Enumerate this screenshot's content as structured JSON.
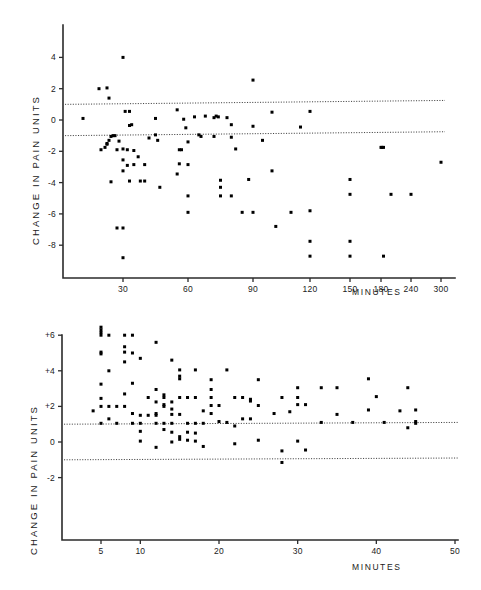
{
  "figure": {
    "y_axis_title": "CHANGE  IN  PAIN  UNITS",
    "x_axis_title": "MINUTES"
  },
  "chart_data": [
    {
      "id": "upper-panel",
      "type": "scatter",
      "title": "",
      "xlabel": "MINUTES",
      "ylabel": "CHANGE IN PAIN UNITS",
      "x_scale": "piecewise-compressed",
      "xlim": [
        0,
        310
      ],
      "ylim": [
        -9.4,
        5.2
      ],
      "grid": false,
      "legend": "none",
      "xtick_labels": [
        "30",
        "60",
        "90",
        "120",
        "150",
        "180",
        "240",
        "300"
      ],
      "xtick_values": [
        30,
        60,
        90,
        120,
        150,
        180,
        240,
        300
      ],
      "ytick_labels": [
        "4",
        "2",
        "0",
        "-2",
        "-4",
        "-6",
        "-8"
      ],
      "ytick_values": [
        4,
        2,
        0,
        -2,
        -4,
        -6,
        -8
      ],
      "reference_lines": [
        {
          "label": "upper-limit",
          "y_left": 1.0,
          "y_right": 1.25,
          "style": "dotted"
        },
        {
          "label": "lower-limit",
          "y_left": -1.0,
          "y_right": -0.75,
          "style": "dotted"
        }
      ],
      "points": [
        [
          10,
          0.1
        ],
        [
          18,
          2.0
        ],
        [
          22,
          2.05
        ],
        [
          23,
          1.4
        ],
        [
          30,
          4.0
        ],
        [
          90,
          2.55
        ],
        [
          19,
          -1.9
        ],
        [
          21,
          -1.75
        ],
        [
          22,
          -1.5
        ],
        [
          22,
          -1.55
        ],
        [
          23,
          -1.3
        ],
        [
          24,
          -1.05
        ],
        [
          25,
          -1.0
        ],
        [
          26,
          -1.0
        ],
        [
          27,
          -1.9
        ],
        [
          28,
          -1.35
        ],
        [
          24,
          -3.95
        ],
        [
          30,
          -3.25
        ],
        [
          30,
          -1.85
        ],
        [
          31,
          0.55
        ],
        [
          33,
          0.55
        ],
        [
          32,
          -1.9
        ],
        [
          33,
          -0.35
        ],
        [
          34,
          -0.3
        ],
        [
          35,
          -1.95
        ],
        [
          30,
          -2.55
        ],
        [
          32,
          -2.9
        ],
        [
          35,
          -2.85
        ],
        [
          33,
          -3.9
        ],
        [
          37,
          -2.35
        ],
        [
          38,
          -3.9
        ],
        [
          40,
          -2.85
        ],
        [
          40,
          -3.9
        ],
        [
          42,
          -1.15
        ],
        [
          45,
          0.1
        ],
        [
          45,
          -0.95
        ],
        [
          46,
          -1.3
        ],
        [
          47,
          -4.3
        ],
        [
          30,
          -6.9
        ],
        [
          27,
          -6.9
        ],
        [
          30,
          -8.8
        ],
        [
          55,
          0.65
        ],
        [
          56,
          -1.9
        ],
        [
          57,
          -1.9
        ],
        [
          56,
          -2.8
        ],
        [
          55,
          -3.45
        ],
        [
          58,
          0.05
        ],
        [
          59,
          -0.5
        ],
        [
          60,
          -1.4
        ],
        [
          60,
          -2.85
        ],
        [
          60,
          -4.85
        ],
        [
          60,
          -5.9
        ],
        [
          63,
          0.2
        ],
        [
          65,
          -0.95
        ],
        [
          66,
          -1.05
        ],
        [
          68,
          0.25
        ],
        [
          72,
          0.15
        ],
        [
          73,
          0.25
        ],
        [
          74,
          0.2
        ],
        [
          72,
          -1.05
        ],
        [
          75,
          -3.85
        ],
        [
          75,
          -4.3
        ],
        [
          75,
          -4.85
        ],
        [
          78,
          0.15
        ],
        [
          80,
          -0.3
        ],
        [
          80,
          -1.1
        ],
        [
          80,
          -4.85
        ],
        [
          82,
          -1.85
        ],
        [
          85,
          -5.9
        ],
        [
          88,
          -3.8
        ],
        [
          90,
          -0.4
        ],
        [
          90,
          -5.9
        ],
        [
          95,
          -1.3
        ],
        [
          100,
          0.5
        ],
        [
          100,
          -3.25
        ],
        [
          102,
          -6.8
        ],
        [
          110,
          -5.9
        ],
        [
          115,
          -0.45
        ],
        [
          120,
          0.55
        ],
        [
          120,
          -5.8
        ],
        [
          120,
          -7.75
        ],
        [
          120,
          -8.7
        ],
        [
          150,
          -3.8
        ],
        [
          150,
          -4.75
        ],
        [
          150,
          -7.75
        ],
        [
          150,
          -8.7
        ],
        [
          180,
          -1.75
        ],
        [
          182,
          -1.75
        ],
        [
          185,
          -1.75
        ],
        [
          185,
          -8.7
        ],
        [
          200,
          -4.75
        ],
        [
          240,
          -4.75
        ],
        [
          300,
          -2.7
        ]
      ]
    },
    {
      "id": "lower-panel",
      "type": "scatter",
      "title": "",
      "xlabel": "MINUTES",
      "ylabel": "CHANGE IN PAIN UNITS",
      "x_scale": "linear",
      "xlim": [
        0,
        50
      ],
      "ylim": [
        -3.2,
        6.7
      ],
      "grid": false,
      "legend": "none",
      "xtick_labels": [
        "5",
        "10",
        "20",
        "30",
        "40",
        "50"
      ],
      "xtick_values": [
        5,
        10,
        20,
        30,
        40,
        50
      ],
      "ytick_labels": [
        "+6",
        "+4",
        "+2",
        "0",
        "-2"
      ],
      "ytick_values": [
        6,
        4,
        2,
        0,
        -2
      ],
      "reference_lines": [
        {
          "label": "upper-limit",
          "y_left": 1.0,
          "y_right": 1.1,
          "style": "dotted"
        },
        {
          "label": "lower-limit",
          "y_left": -1.0,
          "y_right": -0.9,
          "style": "dotted"
        }
      ],
      "points": [
        [
          5,
          6.45
        ],
        [
          5,
          6.3
        ],
        [
          5,
          6.15
        ],
        [
          5,
          6.0
        ],
        [
          6,
          6.0
        ],
        [
          8,
          6.0
        ],
        [
          9,
          6.0
        ],
        [
          5,
          5.05
        ],
        [
          5,
          4.95
        ],
        [
          8,
          5.05
        ],
        [
          9,
          5.0
        ],
        [
          12,
          5.6
        ],
        [
          8,
          5.35
        ],
        [
          8,
          4.5
        ],
        [
          10,
          4.7
        ],
        [
          14,
          4.6
        ],
        [
          6,
          4.0
        ],
        [
          15,
          4.05
        ],
        [
          17,
          4.05
        ],
        [
          21,
          4.05
        ],
        [
          5,
          3.25
        ],
        [
          9,
          3.3
        ],
        [
          12,
          2.95
        ],
        [
          15,
          3.7
        ],
        [
          15,
          3.55
        ],
        [
          19,
          3.5
        ],
        [
          19,
          2.95
        ],
        [
          25,
          3.5
        ],
        [
          30,
          3.05
        ],
        [
          33,
          3.05
        ],
        [
          35,
          3.05
        ],
        [
          39,
          3.55
        ],
        [
          44,
          3.05
        ],
        [
          5,
          2.45
        ],
        [
          8,
          2.7
        ],
        [
          11,
          2.5
        ],
        [
          13,
          2.5
        ],
        [
          13,
          2.65
        ],
        [
          15,
          2.5
        ],
        [
          16,
          2.5
        ],
        [
          17,
          2.5
        ],
        [
          19,
          2.5
        ],
        [
          22,
          2.5
        ],
        [
          23,
          2.5
        ],
        [
          24,
          2.4
        ],
        [
          24,
          2.3
        ],
        [
          28,
          2.5
        ],
        [
          30,
          2.5
        ],
        [
          40,
          2.55
        ],
        [
          4,
          1.75
        ],
        [
          5,
          2.0
        ],
        [
          6,
          2.0
        ],
        [
          7,
          2.0
        ],
        [
          8,
          2.0
        ],
        [
          13,
          2.1
        ],
        [
          13,
          2.0
        ],
        [
          14,
          2.25
        ],
        [
          14,
          1.85
        ],
        [
          19,
          2.05
        ],
        [
          20,
          2.05
        ],
        [
          25,
          2.05
        ],
        [
          30,
          2.1
        ],
        [
          12,
          2.25
        ],
        [
          6,
          1.3
        ],
        [
          9,
          1.6
        ],
        [
          10,
          1.5
        ],
        [
          11,
          1.5
        ],
        [
          12,
          1.5
        ],
        [
          12,
          1.6
        ],
        [
          14,
          1.55
        ],
        [
          15,
          1.55
        ],
        [
          18,
          1.75
        ],
        [
          19,
          1.6
        ],
        [
          23,
          1.3
        ],
        [
          24,
          1.3
        ],
        [
          27,
          1.6
        ],
        [
          29,
          1.7
        ],
        [
          31,
          2.1
        ],
        [
          35,
          1.55
        ],
        [
          39,
          1.8
        ],
        [
          43,
          1.75
        ],
        [
          45,
          1.8
        ],
        [
          5,
          1.05
        ],
        [
          7,
          1.05
        ],
        [
          9,
          1.05
        ],
        [
          10,
          1.05
        ],
        [
          12,
          1.05
        ],
        [
          13,
          1.05
        ],
        [
          14,
          1.05
        ],
        [
          16,
          1.05
        ],
        [
          17,
          1.05
        ],
        [
          18,
          1.05
        ],
        [
          20,
          1.15
        ],
        [
          21,
          1.1
        ],
        [
          22,
          0.9
        ],
        [
          33,
          1.1
        ],
        [
          37,
          1.1
        ],
        [
          41,
          1.1
        ],
        [
          45,
          1.15
        ],
        [
          45,
          1.05
        ],
        [
          44,
          0.8
        ],
        [
          10,
          0.6
        ],
        [
          13,
          0.7
        ],
        [
          14,
          0.55
        ],
        [
          15,
          0.3
        ],
        [
          16,
          0.55
        ],
        [
          17,
          0.5
        ],
        [
          10,
          0.05
        ],
        [
          12,
          -0.3
        ],
        [
          14,
          0.0
        ],
        [
          15,
          0.15
        ],
        [
          16,
          0.1
        ],
        [
          17,
          0.05
        ],
        [
          18,
          -0.25
        ],
        [
          22,
          -0.1
        ],
        [
          25,
          0.1
        ],
        [
          28,
          -0.5
        ],
        [
          30,
          0.05
        ],
        [
          31,
          -0.45
        ],
        [
          28,
          -1.15
        ]
      ]
    }
  ]
}
